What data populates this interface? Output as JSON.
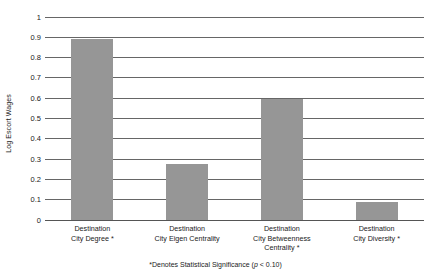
{
  "chart_data": {
    "type": "bar",
    "title": "",
    "xlabel": "",
    "ylabel": "Log Escort Wages",
    "ylim": [
      0,
      1
    ],
    "yticks": [
      "0",
      "0.1",
      "0.2",
      "0.3",
      "0.4",
      "0.5",
      "0.6",
      "0.7",
      "0.8",
      "0.9",
      "1"
    ],
    "ytick_values": [
      0,
      0.1,
      0.2,
      0.3,
      0.4,
      0.5,
      0.6,
      0.7,
      0.8,
      0.9,
      1
    ],
    "grid": true,
    "legend": "none",
    "bar_color": "#969696",
    "categories": [
      "Destination City Degree *",
      "Destination City Eigen Centrality",
      "Destination City Betweenness Centrality *",
      "Destination City Diversity *"
    ],
    "category_lines": [
      [
        "Destination",
        "City Degree *"
      ],
      [
        "Destination",
        "City Eigen Centrality"
      ],
      [
        "Destination",
        "City Betweenness",
        "Centrality *"
      ],
      [
        "Destination",
        "City Diversity *"
      ]
    ],
    "values": [
      0.89,
      0.275,
      0.595,
      0.09
    ],
    "annotations": [
      "*Denotes Statistical Significance (p < 0.10)"
    ]
  },
  "footnote": {
    "prefix": "*Denotes Statistical Significance (",
    "italic": "p",
    "suffix": " < 0.10)"
  }
}
